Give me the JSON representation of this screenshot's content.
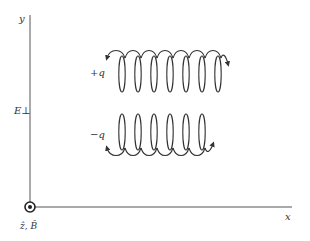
{
  "diagram": {
    "axes": {
      "y_label": "y",
      "x_label": "x",
      "field_label": "E⊥",
      "origin_label": "ẑ, B̂",
      "origin_symbol": "out-of-page-dot-icon"
    },
    "helices": [
      {
        "charge_label": "+q",
        "loops": 8,
        "orientation": "upright",
        "arrow_end": "right-down"
      },
      {
        "charge_label": "−q",
        "loops": 7,
        "orientation": "inverted",
        "arrow_end": "right-up"
      }
    ],
    "colors": {
      "line": "#333333",
      "axis": "#555555",
      "background": "#ffffff"
    }
  }
}
